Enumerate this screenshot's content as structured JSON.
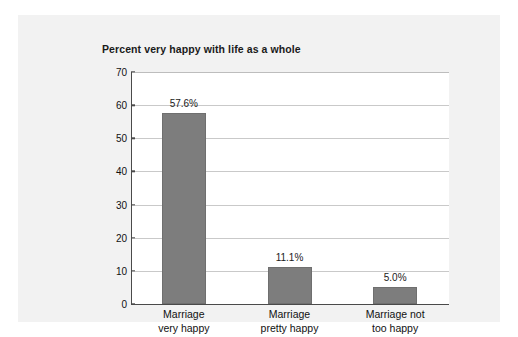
{
  "chart_data": {
    "type": "bar",
    "title": "Percent very happy with life as a whole",
    "xlabel": "",
    "ylabel": "",
    "ylim": [
      0,
      70
    ],
    "yticks": [
      0,
      10,
      20,
      30,
      40,
      50,
      60,
      70
    ],
    "grid": true,
    "legend": false,
    "categories": [
      "Marriage\nvery happy",
      "Marriage\npretty happy",
      "Marriage not\ntoo happy"
    ],
    "category_lines": [
      [
        "Marriage",
        "very happy"
      ],
      [
        "Marriage",
        "pretty happy"
      ],
      [
        "Marriage not",
        "too happy"
      ]
    ],
    "values": [
      57.6,
      11.1,
      5.0
    ],
    "value_labels": [
      "57.6%",
      "11.1%",
      "5.0%"
    ],
    "bar_color": "#7d7d7d",
    "plot_background": "#ffffff",
    "panel_background": "#f2f2f2",
    "gridline_color": "#c9c9c9",
    "axis_color": "#4a4a4a"
  }
}
